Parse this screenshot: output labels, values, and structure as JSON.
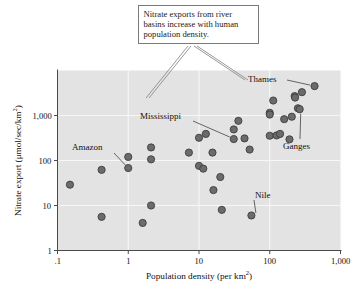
{
  "figure": {
    "background_color": "#ffffff",
    "plot_background_color": "#e3e3e3",
    "grid_color": "#f7f7f7",
    "marker_color": "#6b6b6b",
    "marker_edge_color": "#3d3d3d",
    "axis_color": "#4a4a4a",
    "callout_border_color": "#7a7a7a",
    "leader_color": "#8c8c8c"
  },
  "callout": {
    "text": "Nitrate exports from river basins increase with human population density."
  },
  "annotations": [
    {
      "label": "Thames"
    },
    {
      "label": "Mississippi"
    },
    {
      "label": "Amazon"
    },
    {
      "label": "Ganges"
    },
    {
      "label": "Nile"
    }
  ],
  "chart_data": {
    "type": "scatter",
    "title": "",
    "xlabel": "Population density (per km2)",
    "ylabel": "Nitrate export (umol/sec/km2)",
    "xscale": "log",
    "yscale": "log",
    "xlim": [
      0.1,
      1000
    ],
    "ylim": [
      1,
      10000
    ],
    "grid": true,
    "legend": "none",
    "xticks": [
      0.1,
      1,
      10,
      100,
      1000
    ],
    "xticklabels": [
      ".1",
      "1",
      "10",
      "100",
      "1,000"
    ],
    "yticks": [
      1,
      10,
      100,
      1000
    ],
    "yticklabels": [
      "1",
      "10",
      "100",
      "1,000"
    ],
    "points": [
      {
        "x": 0.15,
        "y": 29
      },
      {
        "x": 0.42,
        "y": 62
      },
      {
        "x": 0.42,
        "y": 5.6
      },
      {
        "x": 1.0,
        "y": 120
      },
      {
        "x": 1.0,
        "y": 68,
        "label": "Amazon"
      },
      {
        "x": 1.6,
        "y": 4.1
      },
      {
        "x": 2.1,
        "y": 195
      },
      {
        "x": 2.1,
        "y": 106
      },
      {
        "x": 2.1,
        "y": 10
      },
      {
        "x": 7.2,
        "y": 150
      },
      {
        "x": 10.0,
        "y": 320
      },
      {
        "x": 10.0,
        "y": 76
      },
      {
        "x": 11.5,
        "y": 66
      },
      {
        "x": 12.5,
        "y": 390
      },
      {
        "x": 15.5,
        "y": 150
      },
      {
        "x": 16.0,
        "y": 22
      },
      {
        "x": 20.0,
        "y": 43
      },
      {
        "x": 21.0,
        "y": 8.0
      },
      {
        "x": 31.0,
        "y": 490
      },
      {
        "x": 31.0,
        "y": 300,
        "label": "Mississippi"
      },
      {
        "x": 36.0,
        "y": 760
      },
      {
        "x": 44.0,
        "y": 310
      },
      {
        "x": 52.0,
        "y": 175
      },
      {
        "x": 55.0,
        "y": 6.0,
        "label": "Nile"
      },
      {
        "x": 100.0,
        "y": 1150
      },
      {
        "x": 100.0,
        "y": 1050
      },
      {
        "x": 100.0,
        "y": 355
      },
      {
        "x": 112.0,
        "y": 2150
      },
      {
        "x": 125.0,
        "y": 360
      },
      {
        "x": 140.0,
        "y": 390
      },
      {
        "x": 160.0,
        "y": 830
      },
      {
        "x": 190.0,
        "y": 295
      },
      {
        "x": 205.0,
        "y": 940
      },
      {
        "x": 225.0,
        "y": 2700
      },
      {
        "x": 228.0,
        "y": 2500
      },
      {
        "x": 250.0,
        "y": 1450
      },
      {
        "x": 265.0,
        "y": 1380,
        "label": "Ganges"
      },
      {
        "x": 285.0,
        "y": 3300
      },
      {
        "x": 430.0,
        "y": 4500,
        "label": "Thames"
      }
    ]
  }
}
